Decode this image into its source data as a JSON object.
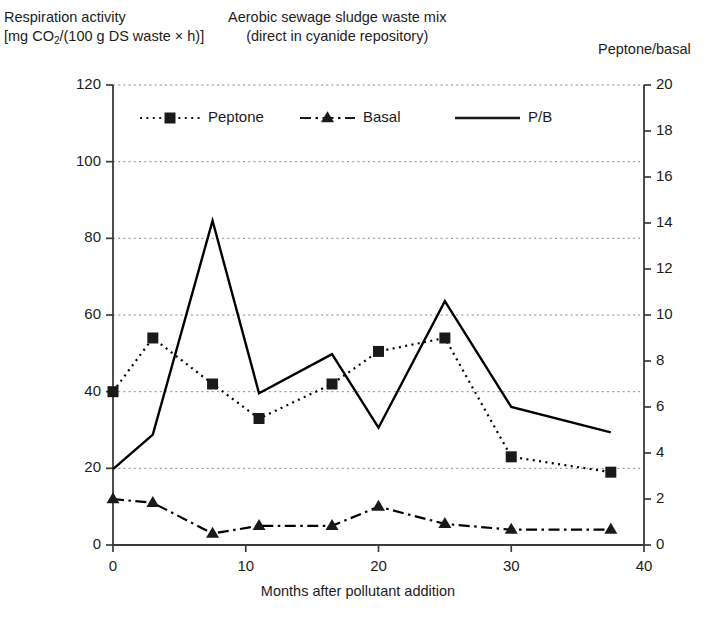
{
  "header": {
    "left_line1": "Respiration activity",
    "left_line2_pre": "[mg CO",
    "left_line2_sub": "2",
    "left_line2_post": "/(100 g DS waste × h)]",
    "middle_line1": "Aerobic sewage sludge waste mix",
    "middle_line2": "(direct in cyanide repository)",
    "right_label": "Peptone/basal"
  },
  "chart_data": {
    "type": "line",
    "title": "Aerobic sewage sludge waste mix (direct in cyanide repository)",
    "subtitle": "(direct in cyanide repository)",
    "xlabel": "Months after pollutant addition",
    "ylabel": "Respiration activity [mg CO2/(100 g DS waste × h)]",
    "y2label": "Peptone/basal",
    "xlim": [
      0,
      40
    ],
    "ylim": [
      0,
      120
    ],
    "y2lim": [
      0,
      20
    ],
    "xticks": [
      0,
      10,
      20,
      30,
      40
    ],
    "yticks": [
      0,
      20,
      40,
      60,
      80,
      100,
      120
    ],
    "y2ticks": [
      0,
      2,
      4,
      6,
      8,
      10,
      12,
      14,
      16,
      18,
      20
    ],
    "grid": true,
    "grid_axis": "y-left",
    "legend_position": "top-inside",
    "x": [
      0,
      3,
      7.5,
      11,
      16.5,
      20,
      25,
      30,
      37.5
    ],
    "series": [
      {
        "name": "Peptone",
        "axis": "left",
        "marker": "square",
        "linestyle": "dotted",
        "color": "#000000",
        "values": [
          40,
          54,
          42,
          33,
          42,
          50.5,
          54,
          23,
          19
        ]
      },
      {
        "name": "Basal",
        "axis": "left",
        "marker": "triangle",
        "linestyle": "dashdot",
        "color": "#000000",
        "values": [
          12,
          11,
          3,
          5,
          5,
          10,
          5.5,
          4,
          4
        ]
      },
      {
        "name": "P/B",
        "axis": "right",
        "marker": "none",
        "linestyle": "solid",
        "color": "#000000",
        "values": [
          3.3,
          4.8,
          14.1,
          6.6,
          8.3,
          5.1,
          10.6,
          6.0,
          4.9
        ]
      }
    ]
  },
  "legend": {
    "items": [
      {
        "label": "Peptone"
      },
      {
        "label": "Basal"
      },
      {
        "label": "P/B"
      }
    ]
  },
  "axis_labels": {
    "x_title": "Months after pollutant addition",
    "y_left_ticks": [
      "0",
      "20",
      "40",
      "60",
      "80",
      "100",
      "120"
    ],
    "y_right_ticks": [
      "0",
      "2",
      "4",
      "6",
      "8",
      "10",
      "12",
      "14",
      "16",
      "18",
      "20"
    ],
    "x_ticks": [
      "0",
      "10",
      "20",
      "30",
      "40"
    ]
  },
  "colors": {
    "ink": "#1a1a1a",
    "grid": "#8a8a8a",
    "axis": "#3a3a3a",
    "background": "#ffffff"
  }
}
